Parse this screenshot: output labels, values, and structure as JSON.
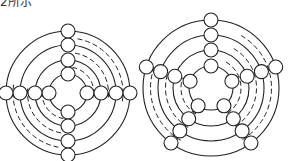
{
  "caption": "2所示",
  "figures": [
    {
      "name": "four-way-ring-diagram",
      "center": [
        68,
        93
      ],
      "ring_radii": [
        19,
        33,
        48,
        62
      ],
      "spokes": 4,
      "spoke_start_angle_deg": -90,
      "node_radius": 7,
      "node_count": 16
    },
    {
      "name": "five-way-ring-diagram",
      "center": [
        211,
        88
      ],
      "ring_radii": [
        22,
        38,
        53,
        68
      ],
      "spokes": 5,
      "spoke_start_angle_deg": -90,
      "node_radius": 7,
      "node_count": 20
    }
  ],
  "colors": {
    "stroke": "#222222",
    "background": "#ffffff"
  }
}
